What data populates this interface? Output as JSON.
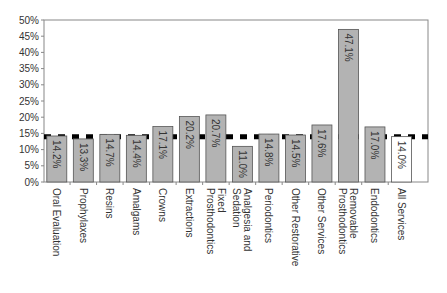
{
  "chart_data": {
    "type": "bar",
    "title": "",
    "xlabel": "",
    "ylabel": "",
    "ylim": [
      0,
      50
    ],
    "yticks": [
      "0%",
      "5%",
      "10%",
      "15%",
      "20%",
      "25%",
      "30%",
      "35%",
      "40%",
      "45%",
      "50%"
    ],
    "grid": false,
    "categories": [
      "Oral Evaluation",
      "Prophylaxes",
      "Resins",
      "Amalgams",
      "Crowns",
      "Extractions",
      "Fixed Prosthodontics",
      "Analgesia and Sedation",
      "Periodontics",
      "Other Restorative",
      "Other Services",
      "Removable Prosthodontics",
      "Endodontics",
      "All Services"
    ],
    "category_lines": [
      [
        "Oral Evaluation"
      ],
      [
        "Prophylaxes"
      ],
      [
        "Resins"
      ],
      [
        "Amalgams"
      ],
      [
        "Crowns"
      ],
      [
        "Extractions"
      ],
      [
        "Fixed",
        "Prosthodontics"
      ],
      [
        "Analgesia and",
        "Sedation"
      ],
      [
        "Periodontics"
      ],
      [
        "Other Restorative"
      ],
      [
        "Other Services"
      ],
      [
        "Removable",
        "Prosthodontics"
      ],
      [
        "Endodontics"
      ],
      [
        "All Services"
      ]
    ],
    "values": [
      14.2,
      13.3,
      14.7,
      14.4,
      17.1,
      20.2,
      20.7,
      11.0,
      14.8,
      14.5,
      17.6,
      47.1,
      17.0,
      14.0
    ],
    "value_labels": [
      "14.2%",
      "13.3%",
      "14.7%",
      "14.4%",
      "17.1%",
      "20.2%",
      "20.7%",
      "11.0%",
      "14.8%",
      "14.5%",
      "17.6%",
      "47.1%",
      "17.0%",
      "14.0%"
    ],
    "reference_line": {
      "value": 14.0,
      "style": "dashed"
    },
    "colors": {
      "bar": "#b3b3b3",
      "bar_highlight": "#ffffff",
      "bar_stroke": "#555555",
      "reference": "#000000",
      "axis": "#888888"
    },
    "highlight_index": 13
  }
}
